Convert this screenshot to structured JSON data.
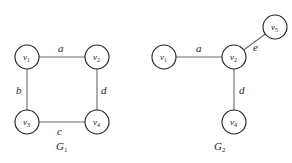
{
  "graphs": [
    {
      "name": "G",
      "sub": "1",
      "nodes": [
        {
          "id": "v1",
          "base": "v",
          "sub": "1",
          "x": 27,
          "y": 57
        },
        {
          "id": "v2",
          "base": "v",
          "sub": "2",
          "x": 97,
          "y": 57
        },
        {
          "id": "v3",
          "base": "v",
          "sub": "3",
          "x": 27,
          "y": 122
        },
        {
          "id": "v4",
          "base": "v",
          "sub": "4",
          "x": 97,
          "y": 122
        }
      ],
      "edges": [
        {
          "label": "a",
          "from": "v1",
          "to": "v2"
        },
        {
          "label": "b",
          "from": "v1",
          "to": "v3"
        },
        {
          "label": "c",
          "from": "v3",
          "to": "v4"
        },
        {
          "label": "d",
          "from": "v2",
          "to": "v4"
        }
      ]
    },
    {
      "name": "G",
      "sub": "2",
      "nodes": [
        {
          "id": "v1",
          "base": "v",
          "sub": "1",
          "x": 164,
          "y": 57
        },
        {
          "id": "v2",
          "base": "v",
          "sub": "2",
          "x": 234,
          "y": 57
        },
        {
          "id": "v5",
          "base": "v",
          "sub": "5",
          "x": 275,
          "y": 27
        },
        {
          "id": "v4",
          "base": "v",
          "sub": "4",
          "x": 234,
          "y": 122
        }
      ],
      "edges": [
        {
          "label": "a",
          "from": "v1",
          "to": "v2"
        },
        {
          "label": "e",
          "from": "v2",
          "to": "v5"
        },
        {
          "label": "d",
          "from": "v2",
          "to": "v4"
        }
      ]
    }
  ]
}
